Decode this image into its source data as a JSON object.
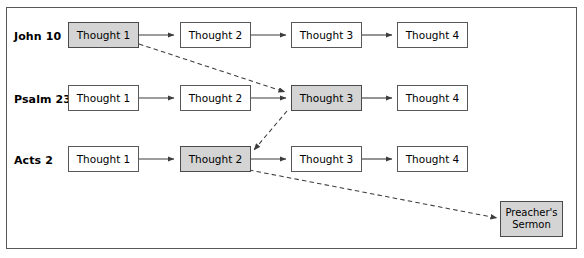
{
  "diagram": {
    "frame": {
      "border_color": "#58585a",
      "background": "#ffffff"
    },
    "shaded_fill": "#d4d4d4",
    "rows": [
      {
        "id": "row-john-10",
        "label": "John 10",
        "nodes": [
          {
            "id": "john10-t1",
            "label": "Thought 1",
            "shaded": true
          },
          {
            "id": "john10-t2",
            "label": "Thought 2",
            "shaded": false
          },
          {
            "id": "john10-t3",
            "label": "Thought 3",
            "shaded": false
          },
          {
            "id": "john10-t4",
            "label": "Thought 4",
            "shaded": false
          }
        ]
      },
      {
        "id": "row-psalm-23",
        "label": "Psalm 23",
        "nodes": [
          {
            "id": "psalm23-t1",
            "label": "Thought 1",
            "shaded": false
          },
          {
            "id": "psalm23-t2",
            "label": "Thought 2",
            "shaded": false
          },
          {
            "id": "psalm23-t3",
            "label": "Thought 3",
            "shaded": true
          },
          {
            "id": "psalm23-t4",
            "label": "Thought 4",
            "shaded": false
          }
        ]
      },
      {
        "id": "row-acts-2",
        "label": "Acts 2",
        "nodes": [
          {
            "id": "acts2-t1",
            "label": "Thought 1",
            "shaded": false
          },
          {
            "id": "acts2-t2",
            "label": "Thought 2",
            "shaded": true
          },
          {
            "id": "acts2-t3",
            "label": "Thought 3",
            "shaded": false
          },
          {
            "id": "acts2-t4",
            "label": "Thought 4",
            "shaded": false
          }
        ]
      }
    ],
    "outcome": {
      "id": "preachers-sermon",
      "label_line1": "Preacher's",
      "label_line2": "Sermon",
      "shaded": true
    },
    "connectors": {
      "solid_label": "sequential thought arrow",
      "dashed_label": "cross-passage link arrow",
      "solid_count": 9,
      "dashed_count": 3
    }
  }
}
